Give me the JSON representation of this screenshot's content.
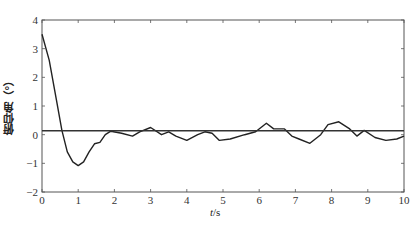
{
  "chart_data": {
    "type": "line",
    "title": "",
    "xlabel": "t/s",
    "xlabel_var": "t",
    "xlabel_unit": "/s",
    "ylabel": "俯仰角（°）",
    "xlim": [
      0,
      10
    ],
    "ylim": [
      -2,
      4
    ],
    "xticks": [
      0,
      1,
      2,
      3,
      4,
      5,
      6,
      7,
      8,
      9,
      10
    ],
    "yticks": [
      -2,
      -1,
      0,
      1,
      2,
      3,
      4
    ],
    "grid": false,
    "legend": null,
    "series": [
      {
        "name": "pitch angle",
        "color": "#222222",
        "x": [
          0,
          0.2,
          0.4,
          0.55,
          0.7,
          0.85,
          1.0,
          1.15,
          1.3,
          1.45,
          1.6,
          1.75,
          1.9,
          2.2,
          2.5,
          2.7,
          3.0,
          3.3,
          3.5,
          3.7,
          4.0,
          4.3,
          4.5,
          4.7,
          4.9,
          5.2,
          5.6,
          5.9,
          6.2,
          6.4,
          6.7,
          6.9,
          7.1,
          7.4,
          7.7,
          7.9,
          8.2,
          8.5,
          8.7,
          8.9,
          9.2,
          9.5,
          9.8,
          10.0
        ],
        "values": [
          3.5,
          2.6,
          1.2,
          0.15,
          -0.6,
          -0.95,
          -1.08,
          -0.95,
          -0.6,
          -0.32,
          -0.27,
          0.0,
          0.12,
          0.05,
          -0.05,
          0.1,
          0.25,
          0.0,
          0.1,
          -0.05,
          -0.2,
          0.0,
          0.1,
          0.05,
          -0.2,
          -0.15,
          0.0,
          0.1,
          0.4,
          0.2,
          0.2,
          -0.05,
          -0.15,
          -0.3,
          0.0,
          0.35,
          0.45,
          0.2,
          -0.05,
          0.15,
          -0.1,
          -0.2,
          -0.15,
          -0.05
        ]
      },
      {
        "name": "reference",
        "color": "#333333",
        "x": [
          0,
          10
        ],
        "values": [
          0.14,
          0.14
        ]
      }
    ]
  }
}
